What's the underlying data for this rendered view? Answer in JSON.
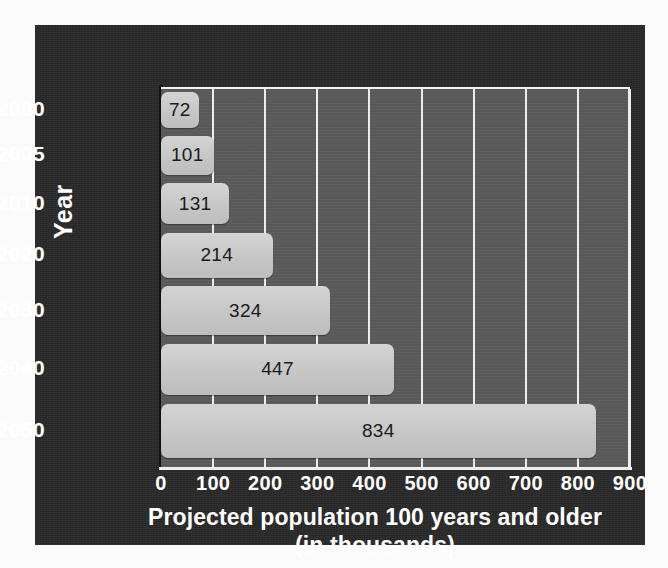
{
  "chart_data": {
    "type": "bar",
    "orientation": "horizontal",
    "title": "",
    "xlabel_line1": "Projected population 100 years and older",
    "xlabel_line2": "(in thousands)",
    "ylabel": "Year",
    "categories": [
      "2000",
      "2005",
      "2010",
      "2020",
      "2030",
      "2040",
      "2050"
    ],
    "values": [
      72,
      101,
      131,
      214,
      324,
      447,
      834
    ],
    "value_labels": [
      "72",
      "101",
      "131",
      "214",
      "324",
      "447",
      "834"
    ],
    "xticks": [
      "0",
      "100",
      "200",
      "300",
      "400",
      "500",
      "600",
      "700",
      "800",
      "900"
    ],
    "xlim": [
      0,
      900
    ],
    "grid": "vertical",
    "legend": "none",
    "colors": {
      "bar": "#c9c9c9",
      "plot_background": "#5c5c5c",
      "panel_background": "#2b2a2a",
      "gridline": "#ededed",
      "axis_text": "#ffffff",
      "value_text": "#1b1b1b"
    }
  }
}
